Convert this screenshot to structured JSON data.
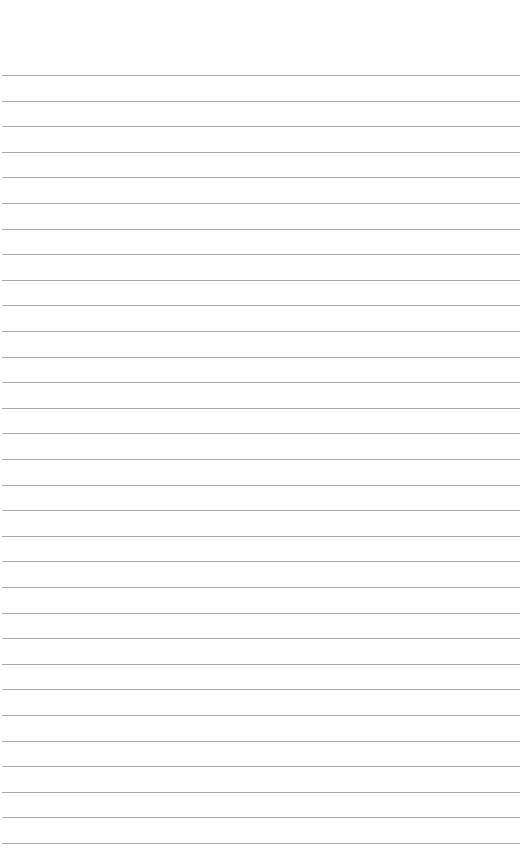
{
  "page": {
    "type": "lined-paper",
    "line_count": 31,
    "first_line_y": 75,
    "line_spacing": 25.6,
    "line_color": "#a9a9a9",
    "background_color": "#ffffff"
  }
}
